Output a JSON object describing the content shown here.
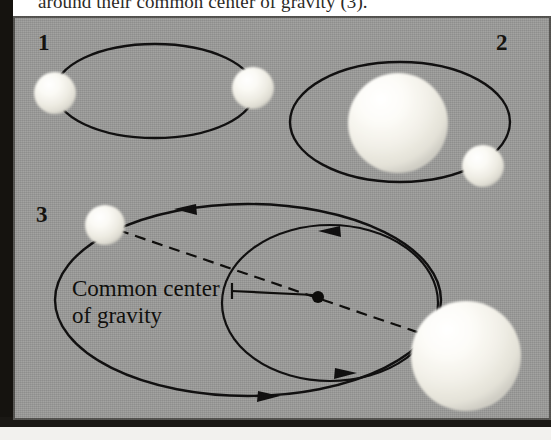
{
  "figure": {
    "caption_truncated": "around their common center of gravity (3).",
    "background_color": "#9b9b99",
    "ink_color": "#111010",
    "sphere_color": "#f6f5ef"
  },
  "panels": [
    {
      "number": "1",
      "number_pos": {
        "x": 44,
        "y": 50
      },
      "description": "Two equal-mass stars on a shared elliptical orbit",
      "orbit": {
        "cx": 155,
        "cy": 91,
        "rx": 100,
        "ry": 47
      },
      "bodies": [
        {
          "name": "star-left-equal",
          "cx": 55,
          "cy": 93,
          "r": 21
        },
        {
          "name": "star-right-equal",
          "cx": 253,
          "cy": 88,
          "r": 21
        }
      ]
    },
    {
      "number": "2",
      "number_pos": {
        "x": 503,
        "y": 50
      },
      "description": "Massive star with a small companion on the ellipse",
      "orbit": {
        "cx": 400,
        "cy": 122,
        "rx": 110,
        "ry": 60
      },
      "bodies": [
        {
          "name": "star-massive",
          "cx": 398,
          "cy": 123,
          "r": 50
        },
        {
          "name": "star-companion-small",
          "cx": 483,
          "cy": 166,
          "r": 21
        }
      ]
    },
    {
      "number": "3",
      "number_pos": {
        "x": 42,
        "y": 222
      },
      "description": "Both stars orbit the shared barycentre on two ellipses",
      "label": {
        "line1": "Common center",
        "line2": "of gravity"
      },
      "label_pos": {
        "x": 72,
        "y": 296,
        "line_height": 27
      },
      "barycentre": {
        "cx": 318,
        "cy": 297,
        "r": 6
      },
      "orbit_outer": {
        "cx": 248,
        "cy": 300,
        "rx": 193,
        "ry": 96
      },
      "orbit_inner": {
        "cx": 330,
        "cy": 303,
        "rx": 108,
        "ry": 78
      },
      "bodies": [
        {
          "name": "star-small-orbiting",
          "cx": 105,
          "cy": 225,
          "r": 20
        },
        {
          "name": "star-large-orbiting",
          "cx": 466,
          "cy": 356,
          "r": 55
        }
      ],
      "connector": "dashed-line-through-barycentre",
      "arrows": [
        {
          "name": "arrow-outer-top",
          "x": 188,
          "y": 207
        },
        {
          "name": "arrow-outer-bottom",
          "x": 268,
          "y": 396
        },
        {
          "name": "arrow-inner-top",
          "x": 333,
          "y": 230
        },
        {
          "name": "arrow-inner-bottom",
          "x": 345,
          "y": 373
        }
      ]
    }
  ]
}
